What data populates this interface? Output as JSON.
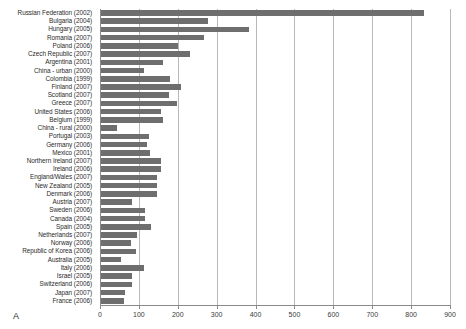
{
  "panel": {
    "letter": "A"
  },
  "chart_data": {
    "type": "bar",
    "orientation": "horizontal",
    "title": "",
    "xlabel": "",
    "ylabel": "",
    "xlim": [
      0,
      900
    ],
    "xticks": [
      0,
      100,
      200,
      300,
      400,
      500,
      600,
      700,
      800,
      900
    ],
    "xtick_labels": [
      "0",
      "100",
      "200",
      "300",
      "400",
      "500",
      "600",
      "700",
      "800",
      "900"
    ],
    "grid": true,
    "legend": "none",
    "bar_color": "#6e6e6e",
    "grid_color": "#b9b9b9",
    "axis_color": "#8a8a8a",
    "categories": [
      "Russian Federation (2002)",
      "Bulgaria (2004)",
      "Hungary (2005)",
      "Romania (2007)",
      "Poland (2006)",
      "Czech Republic (2007)",
      "Argentina (2001)",
      "China - urban (2000)",
      "Colombia (1999)",
      "Finland (2007)",
      "Scotland (2007)",
      "Greece (2007)",
      "United States (2006)",
      "Belgium (1999)",
      "China - rural (2000)",
      "Portugal (2003)",
      "Germany (2006)",
      "Mexico (2001)",
      "Northern Ireland (2007)",
      "Ireland (2006)",
      "England/Wales (2007)",
      "New Zealand (2005)",
      "Denmark (2006)",
      "Austria (2007)",
      "Sweden (2006)",
      "Canada (2004)",
      "Spain (2005)",
      "Netherlands (2007)",
      "Norway (2006)",
      "Republic of Korea (2006)",
      "Australia (2005)",
      "Italy (2006)",
      "Israel (2005)",
      "Switzerland (2006)",
      "Japan (2007)",
      "France (2006)"
    ],
    "values": [
      830,
      275,
      380,
      265,
      198,
      230,
      160,
      110,
      178,
      205,
      176,
      196,
      153,
      160,
      41,
      123,
      119,
      127,
      153,
      153,
      145,
      145,
      145,
      80,
      113,
      112,
      128,
      93,
      76,
      91,
      51,
      110,
      80,
      80,
      61,
      58
    ]
  }
}
